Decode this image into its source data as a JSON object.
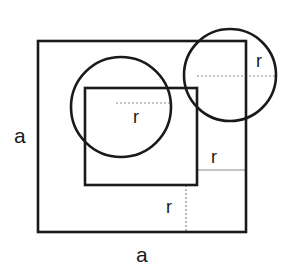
{
  "figure": {
    "canvas": {
      "width": 295,
      "height": 278,
      "background": "#ffffff"
    },
    "colors": {
      "stroke_heavy": "#1a1a1a",
      "stroke_light": "#8a8a8a",
      "text": "#1a1a1a",
      "background": "#ffffff"
    },
    "shapes": {
      "outer_square": {
        "name": "outer-square",
        "x": 38,
        "y": 41,
        "width": 208,
        "height": 191,
        "stroke_width": 2.6
      },
      "inner_square": {
        "name": "inner-square",
        "x": 85,
        "y": 88,
        "width": 112,
        "height": 97,
        "stroke_width": 2.6
      },
      "left_circle": {
        "name": "left-circle",
        "cx": 121,
        "cy": 107,
        "r": 50,
        "stroke_width": 2.6
      },
      "right_circle": {
        "name": "right-circle",
        "cx": 230,
        "cy": 75,
        "r": 46,
        "stroke_width": 2.6
      }
    },
    "dimension_lines": {
      "left_circle_radius": {
        "x1": 116,
        "y1": 103,
        "x2": 170,
        "y2": 103,
        "style": "dotted"
      },
      "right_circle_radius": {
        "x1": 197,
        "y1": 76,
        "x2": 277,
        "y2": 76,
        "style": "dotted"
      },
      "right_gap": {
        "x1": 197,
        "y1": 170,
        "x2": 246,
        "y2": 170,
        "style": "solid-thin"
      },
      "bottom_gap": {
        "x1": 186,
        "y1": 185,
        "x2": 186,
        "y2": 232,
        "style": "dotted"
      }
    },
    "labels": {
      "side_left": {
        "text": "a",
        "x": 14,
        "y": 125
      },
      "side_bottom": {
        "text": "a",
        "x": 136,
        "y": 244
      },
      "radius_left_circle": {
        "text": "r",
        "x": 133,
        "y": 108
      },
      "radius_right_circle": {
        "text": "r",
        "x": 256,
        "y": 52
      },
      "radius_right_gap": {
        "text": "r",
        "x": 211,
        "y": 148
      },
      "radius_bottom_gap": {
        "text": "r",
        "x": 166,
        "y": 198
      }
    }
  },
  "chart_data": {
    "type": "diagram",
    "elements": [
      {
        "id": "outer-square",
        "kind": "square",
        "label": "a",
        "side_label": "a",
        "x": 38,
        "y": 41,
        "width": 208,
        "height": 191
      },
      {
        "id": "inner-square",
        "kind": "square",
        "x": 85,
        "y": 88,
        "width": 112,
        "height": 97
      },
      {
        "id": "left-circle",
        "kind": "circle",
        "radius_label": "r",
        "cx": 121,
        "cy": 107,
        "r": 50
      },
      {
        "id": "right-circle",
        "kind": "circle",
        "radius_label": "r",
        "cx": 230,
        "cy": 75,
        "r": 46
      }
    ],
    "annotations": [
      {
        "id": "radius-left",
        "text": "r",
        "x": 133,
        "y": 108
      },
      {
        "id": "radius-right",
        "text": "r",
        "x": 256,
        "y": 52
      },
      {
        "id": "offset-right",
        "text": "r",
        "x": 211,
        "y": 148
      },
      {
        "id": "offset-bottom",
        "text": "r",
        "x": 166,
        "y": 198
      },
      {
        "id": "side-left",
        "text": "a",
        "x": 14,
        "y": 125
      },
      {
        "id": "side-bottom",
        "text": "a",
        "x": 136,
        "y": 244
      }
    ]
  }
}
